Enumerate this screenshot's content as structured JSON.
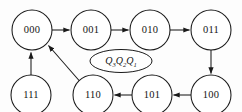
{
  "diagram": {
    "type": "state-transition-diagram",
    "background_color": "#fdfdfd",
    "stroke_color": "#1a1a1a",
    "center_label": {
      "base1": "Q",
      "sub1": "3",
      "base2": "Q",
      "sub2": "2",
      "base3": "Q",
      "sub3": "1",
      "full_text": "Q3Q2Q1"
    },
    "nodes": [
      {
        "id": "n000",
        "label": "000",
        "cx": 32,
        "cy": 30,
        "r": 20
      },
      {
        "id": "n001",
        "label": "001",
        "cx": 91,
        "cy": 30,
        "r": 20
      },
      {
        "id": "n010",
        "label": "010",
        "cx": 150,
        "cy": 30,
        "r": 20
      },
      {
        "id": "n011",
        "label": "011",
        "cx": 211,
        "cy": 30,
        "r": 20
      },
      {
        "id": "n100",
        "label": "100",
        "cx": 211,
        "cy": 95,
        "r": 20
      },
      {
        "id": "n101",
        "label": "101",
        "cx": 152,
        "cy": 95,
        "r": 20
      },
      {
        "id": "n110",
        "label": "110",
        "cx": 93,
        "cy": 95,
        "r": 20
      },
      {
        "id": "n111",
        "label": "111",
        "cx": 31,
        "cy": 95,
        "r": 20
      }
    ],
    "edges": [
      {
        "id": "e1",
        "from": "000",
        "to": "001",
        "direction": "right"
      },
      {
        "id": "e2",
        "from": "001",
        "to": "010",
        "direction": "right"
      },
      {
        "id": "e3",
        "from": "010",
        "to": "011",
        "direction": "right"
      },
      {
        "id": "e4",
        "from": "011",
        "to": "100",
        "direction": "down"
      },
      {
        "id": "e5",
        "from": "100",
        "to": "101",
        "direction": "left"
      },
      {
        "id": "e6",
        "from": "101",
        "to": "110",
        "direction": "left"
      },
      {
        "id": "e7",
        "from": "110",
        "to": "000",
        "direction": "up-left-diagonal"
      },
      {
        "id": "e8",
        "from": "111",
        "to": "000",
        "direction": "up"
      }
    ]
  }
}
